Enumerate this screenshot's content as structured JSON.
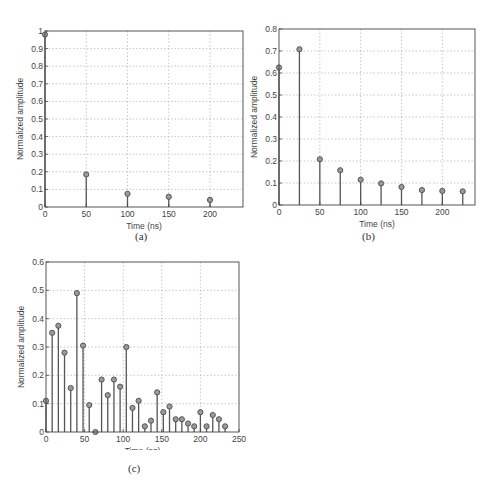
{
  "chart_data": [
    {
      "id": "a",
      "type": "stem",
      "caption": "(a)",
      "xlabel": "Time (ns)",
      "ylabel": "Normalized amplitude",
      "xlim": [
        0,
        240
      ],
      "ylim": [
        0,
        1
      ],
      "xticks": [
        0,
        50,
        100,
        150,
        200
      ],
      "yticks": [
        0,
        0.1,
        0.2,
        0.3,
        0.4,
        0.5,
        0.6,
        0.7,
        0.8,
        0.9,
        1
      ],
      "ytick_labels": [
        "0",
        "0.1",
        "0.2",
        "0.3",
        "0.4",
        "0.5",
        "0.6",
        "0.7",
        "0.8",
        "0.9",
        "1"
      ],
      "grid": true,
      "x": [
        0,
        50,
        100,
        150,
        200
      ],
      "values": [
        0.98,
        0.185,
        0.075,
        0.058,
        0.04
      ]
    },
    {
      "id": "b",
      "type": "stem",
      "caption": "(b)",
      "xlabel": "Time (ns)",
      "ylabel": "Normalized amplitude",
      "xlim": [
        0,
        240
      ],
      "ylim": [
        0,
        0.8
      ],
      "xticks": [
        0,
        50,
        100,
        150,
        200
      ],
      "yticks": [
        0,
        0.1,
        0.2,
        0.3,
        0.4,
        0.5,
        0.6,
        0.7,
        0.8
      ],
      "ytick_labels": [
        "0",
        "0.1",
        "0.2",
        "0.3",
        "0.4",
        "0.5",
        "0.6",
        "0.7",
        "0.8"
      ],
      "grid": true,
      "x": [
        0,
        25,
        50,
        75,
        100,
        125,
        150,
        175,
        200,
        225
      ],
      "values": [
        0.625,
        0.708,
        0.208,
        0.158,
        0.115,
        0.098,
        0.082,
        0.068,
        0.064,
        0.062
      ]
    },
    {
      "id": "c",
      "type": "stem",
      "caption": "(c)",
      "xlabel": "Time (ns)",
      "ylabel": "Normalized amplitude",
      "xlim": [
        0,
        250
      ],
      "ylim": [
        0,
        0.6
      ],
      "xticks": [
        0,
        50,
        100,
        150,
        200,
        250
      ],
      "yticks": [
        0,
        0.1,
        0.2,
        0.3,
        0.4,
        0.5,
        0.6
      ],
      "ytick_labels": [
        "0",
        "0.1",
        "0.2",
        "0.3",
        "0.4",
        "0.5",
        "0.6"
      ],
      "grid": true,
      "x": [
        0,
        8,
        16,
        24,
        32,
        40,
        48,
        56,
        64,
        72,
        80,
        88,
        96,
        104,
        112,
        120,
        128,
        136,
        144,
        152,
        160,
        168,
        176,
        184,
        192,
        200,
        208,
        216,
        224,
        232
      ],
      "values": [
        0.11,
        0.35,
        0.375,
        0.28,
        0.155,
        0.49,
        0.305,
        0.095,
        0.0,
        0.185,
        0.13,
        0.185,
        0.16,
        0.3,
        0.085,
        0.11,
        0.02,
        0.04,
        0.14,
        0.07,
        0.09,
        0.045,
        0.045,
        0.03,
        0.02,
        0.07,
        0.02,
        0.06,
        0.045,
        0.02
      ]
    }
  ],
  "panels": {
    "a": {
      "caption": "(a)",
      "xlabel": "Time (ns)",
      "ylabel": "Normalized amplitude"
    },
    "b": {
      "caption": "(b)",
      "xlabel": "Time (ns)",
      "ylabel": "Normalized amplitude"
    },
    "c": {
      "caption": "(c)",
      "xlabel": "Time (ns)",
      "ylabel": "Normalized amplitude"
    }
  },
  "style": {
    "stem_color": "#555555",
    "marker_fill": "#9a9a9a",
    "grid_color": "#b0b0b0",
    "axis_color": "#444444"
  }
}
